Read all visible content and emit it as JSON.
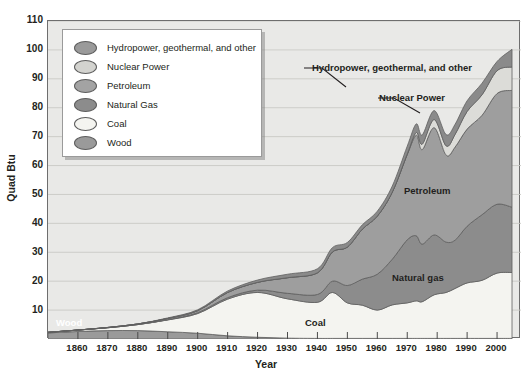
{
  "chart_data": {
    "type": "area",
    "title": "",
    "xlabel": "Year",
    "ylabel": "Quad Btu",
    "xlim": [
      1850,
      2008
    ],
    "ylim": [
      0,
      110
    ],
    "grid": true,
    "stacked": true,
    "legend_position": "upper-left-inset",
    "xticks": [
      1860,
      1870,
      1880,
      1890,
      1900,
      1910,
      1920,
      1930,
      1940,
      1950,
      1960,
      1970,
      1980,
      1990,
      2000
    ],
    "yticks": [
      10,
      20,
      30,
      40,
      50,
      60,
      70,
      80,
      90,
      100,
      110
    ],
    "x": [
      1850,
      1860,
      1870,
      1880,
      1890,
      1900,
      1910,
      1920,
      1930,
      1940,
      1945,
      1950,
      1955,
      1960,
      1965,
      1970,
      1973,
      1975,
      1979,
      1983,
      1986,
      1990,
      1995,
      2000,
      2005
    ],
    "series": [
      {
        "name": "Wood",
        "color": "#9a9a9a",
        "values": [
          2.1,
          2.6,
          2.9,
          2.9,
          2.5,
          2.0,
          1.1,
          0.6,
          0.3,
          0.2,
          0.2,
          0.2,
          0.2,
          0.2,
          0.2,
          0.2,
          0.2,
          0.2,
          0.2,
          0.2,
          0.2,
          0.2,
          0.2,
          0.2,
          0.2
        ]
      },
      {
        "name": "Coal",
        "color": "#f4f4f0",
        "values": [
          0.2,
          0.5,
          1.0,
          2.1,
          4.1,
          6.8,
          12.7,
          15.5,
          13.6,
          12.5,
          15.9,
          12.3,
          11.5,
          9.8,
          11.6,
          12.3,
          13.0,
          12.7,
          15.1,
          15.9,
          17.3,
          19.2,
          20.1,
          22.6,
          22.8
        ]
      },
      {
        "name": "Natural Gas",
        "color": "#8c8c8c",
        "values": [
          0.0,
          0.0,
          0.0,
          0.0,
          0.1,
          0.3,
          0.5,
          0.8,
          1.9,
          2.7,
          3.9,
          6.0,
          9.0,
          12.4,
          15.8,
          21.8,
          22.5,
          19.9,
          20.7,
          17.4,
          16.7,
          19.6,
          22.7,
          23.8,
          22.6
        ]
      },
      {
        "name": "Petroleum",
        "color": "#9e9e9e",
        "values": [
          0.0,
          0.0,
          0.1,
          0.2,
          0.4,
          0.7,
          1.8,
          2.7,
          5.4,
          7.5,
          10.1,
          13.3,
          17.3,
          20.1,
          23.2,
          29.5,
          34.8,
          32.7,
          37.1,
          30.1,
          32.2,
          33.6,
          34.4,
          38.3,
          40.4
        ]
      },
      {
        "name": "Nuclear Power",
        "color": "#dcdcd8",
        "values": [
          0.0,
          0.0,
          0.0,
          0.0,
          0.0,
          0.0,
          0.0,
          0.0,
          0.0,
          0.0,
          0.0,
          0.0,
          0.0,
          0.0,
          0.0,
          0.2,
          0.9,
          1.9,
          2.8,
          3.2,
          4.4,
          6.1,
          7.1,
          7.9,
          8.1
        ]
      },
      {
        "name": "Hydropower, geothermal, and other",
        "color": "#8a8a8a",
        "values": [
          0.0,
          0.0,
          0.0,
          0.0,
          0.2,
          0.3,
          0.5,
          0.8,
          1.2,
          1.4,
          1.5,
          1.6,
          1.5,
          1.7,
          2.1,
          2.7,
          3.0,
          3.2,
          3.1,
          3.9,
          3.5,
          3.7,
          4.0,
          3.2,
          6.1
        ]
      }
    ],
    "annotations": [
      {
        "text": "Hydropower, geothermal, and other",
        "name": "hydropower"
      },
      {
        "text": "Nuclear Power",
        "name": "nuclear"
      },
      {
        "text": "Petroleum",
        "name": "petroleum"
      },
      {
        "text": "Natural gas",
        "name": "natural-gas"
      },
      {
        "text": "Coal",
        "name": "coal"
      },
      {
        "text": "Wood",
        "name": "wood"
      }
    ]
  },
  "axes": {
    "y_label": "Quad Btu",
    "x_label": "Year",
    "y_ticks": [
      "110",
      "100",
      "90",
      "80",
      "70",
      "60",
      "50",
      "40",
      "30",
      "20",
      "10"
    ],
    "x_ticks": [
      "1860",
      "1870",
      "1880",
      "1890",
      "1900",
      "1910",
      "1920",
      "1930",
      "1940",
      "1950",
      "1960",
      "1970",
      "1980",
      "1990",
      "2000"
    ]
  },
  "legend": {
    "items": [
      {
        "label": "Hydropower, geothermal, and other",
        "color": "#9a9a9a"
      },
      {
        "label": "Nuclear Power",
        "color": "#d3d3cf"
      },
      {
        "label": "Petroleum",
        "color": "#a3a3a3"
      },
      {
        "label": "Natural Gas",
        "color": "#8c8c8c"
      },
      {
        "label": "Coal",
        "color": "#f4f4f0"
      },
      {
        "label": "Wood",
        "color": "#9a9a9a"
      }
    ]
  },
  "annotations": {
    "hydropower": "Hydropower, geothermal, and other",
    "nuclear": "Nuclear Power",
    "petroleum": "Petroleum",
    "natural_gas": "Natural gas",
    "coal": "Coal",
    "wood": "Wood"
  },
  "caption": ""
}
